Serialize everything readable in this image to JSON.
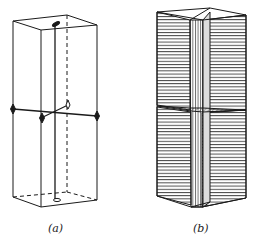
{
  "figure": {
    "panels": [
      {
        "id": "a",
        "caption": "(a)",
        "description": "Prism outline with vertical axis rod, horizontal twofold axes with diamond markers"
      },
      {
        "id": "b",
        "caption": "(b)",
        "description": "Hatched prism composed of twinned plates with central vertical slab"
      }
    ]
  },
  "colors": {
    "line": "#1a1a1a",
    "background": "#ffffff"
  }
}
